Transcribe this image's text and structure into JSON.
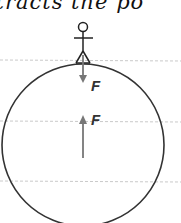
{
  "caption_text": "ttracts the po",
  "diagram": {
    "force_down_label": "F",
    "force_up_label": "F",
    "colors": {
      "outline": "#333333",
      "arrow": "#777777",
      "rule": "#bbbbbb"
    }
  }
}
